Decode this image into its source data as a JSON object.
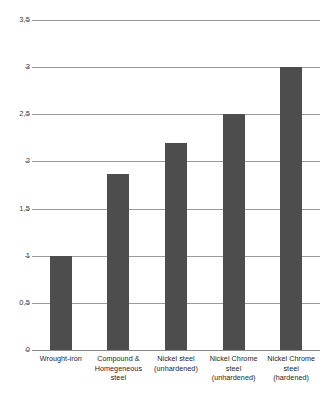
{
  "chart_data": {
    "type": "bar",
    "title": "",
    "subtitle": "",
    "xlabel": "",
    "ylabel": "",
    "categories": [
      "Wrought-iron",
      "Compound & Homegeneous steel",
      "Nickel steel (unhardened)",
      "Nickel Chrome steel (unhardened)",
      "Nickel Chrome steel (hardened)"
    ],
    "category_lines": [
      [
        "Wrought-iron"
      ],
      [
        "Compound &",
        "Homegeneous",
        "steel"
      ],
      [
        "Nickel steel",
        "(unhardened)"
      ],
      [
        "Nickel Chrome",
        "steel",
        "(unhardened)"
      ],
      [
        "Nickel Chrome",
        "steel",
        "(hardened)"
      ]
    ],
    "values": [
      1,
      1.87,
      2.2,
      2.5,
      3
    ],
    "ylim": [
      0,
      3.5
    ],
    "yticks": [
      0,
      0.5,
      1,
      1.5,
      2,
      2.5,
      3,
      3.5
    ],
    "ytick_labels": [
      "0",
      "0,5",
      "1",
      "1,5",
      "2",
      "2,5",
      "3",
      "3,5"
    ],
    "grid": true,
    "legend": false,
    "legend_position": "none",
    "colors": {
      "bar": "#4d4d4d",
      "gridline": "#9a9a9a",
      "baseline": "#8a8a8a",
      "tick_text": "#3d3d3d",
      "category_text": "#1c1c1c",
      "background": "#ffffff"
    }
  }
}
